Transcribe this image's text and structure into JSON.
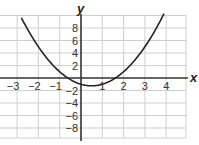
{
  "chart_data": {
    "type": "line",
    "title": "",
    "xlabel": "x",
    "ylabel": "y",
    "xlim": [
      -3.8,
      4.9
    ],
    "ylim": [
      -9.6,
      10
    ],
    "grid": true,
    "x_ticks": [
      "−3",
      "−2",
      "−1",
      "1",
      "2",
      "3",
      "4"
    ],
    "y_ticks": [
      "8",
      "6",
      "4",
      "2",
      "−2",
      "−4",
      "−6",
      "−8"
    ],
    "series": [
      {
        "name": "parabola",
        "equation_estimate": "y = x^2 - x - 1",
        "color": "#222222",
        "x": [
          -2.8,
          -2,
          -1,
          -0.618,
          0,
          0.5,
          1,
          1.618,
          2,
          3,
          3.9
        ],
        "y": [
          9.64,
          5,
          1,
          0,
          -1,
          -1.25,
          -1,
          0,
          1,
          5,
          10.31
        ]
      }
    ]
  },
  "colors": {
    "grid": "#cfcfcf",
    "axis": "#333333",
    "curve": "#222222"
  }
}
